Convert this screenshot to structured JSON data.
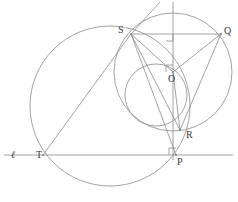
{
  "figure": {
    "stroke_color": "#8a8a8a",
    "label_color": "#3a3a3a",
    "background": "#ffffff",
    "width": 238,
    "height": 202
  },
  "labels": [
    {
      "id": "ell",
      "text": "ℓ",
      "x": 11,
      "y": 150,
      "italic": true,
      "name": "label-line-ell"
    },
    {
      "id": "T",
      "text": "T",
      "x": 36,
      "y": 150,
      "italic": false,
      "name": "label-point-t"
    },
    {
      "id": "S",
      "text": "S",
      "x": 118,
      "y": 25,
      "italic": false,
      "name": "label-point-s"
    },
    {
      "id": "Q",
      "text": "Q",
      "x": 224,
      "y": 26,
      "italic": false,
      "name": "label-point-q"
    },
    {
      "id": "O",
      "text": "O",
      "x": 168,
      "y": 74,
      "italic": false,
      "name": "label-point-o"
    },
    {
      "id": "R",
      "text": "R",
      "x": 186,
      "y": 130,
      "italic": false,
      "name": "label-point-r"
    },
    {
      "id": "P",
      "text": "P",
      "x": 177,
      "y": 157,
      "italic": false,
      "name": "label-point-p"
    }
  ],
  "points": {
    "S": {
      "x": 131,
      "y": 34
    },
    "Q": {
      "x": 221,
      "y": 34
    },
    "O": {
      "x": 173,
      "y": 72
    },
    "R": {
      "x": 180,
      "y": 130
    },
    "P": {
      "x": 176,
      "y": 155
    },
    "T": {
      "x": 43,
      "y": 155
    },
    "L": {
      "x": 173,
      "y": 34
    }
  },
  "circles": [
    {
      "name": "circle-large-through-S-T-R",
      "cx": 110,
      "cy": 106,
      "r": 80
    },
    {
      "name": "circle-center-O-through-S-Q-R",
      "cx": 173,
      "cy": 72,
      "r": 59
    },
    {
      "name": "circle-small-through-S-O-R-P",
      "cx": 156,
      "cy": 95,
      "r": 31
    }
  ],
  "segments": [
    {
      "name": "segment-SQ",
      "x1": 131,
      "y1": 34,
      "x2": 221,
      "y2": 34
    },
    {
      "name": "segment-SO",
      "x1": 131,
      "y1": 34,
      "x2": 173,
      "y2": 72
    },
    {
      "name": "segment-OQ",
      "x1": 173,
      "y1": 72,
      "x2": 221,
      "y2": 34
    },
    {
      "name": "segment-OR",
      "x1": 173,
      "y1": 72,
      "x2": 180,
      "y2": 130
    },
    {
      "name": "segment-SR",
      "x1": 131,
      "y1": 34,
      "x2": 180,
      "y2": 130
    },
    {
      "name": "segment-SP",
      "x1": 131,
      "y1": 34,
      "x2": 176,
      "y2": 155
    },
    {
      "name": "segment-QR",
      "x1": 221,
      "y1": 34,
      "x2": 180,
      "y2": 130
    },
    {
      "name": "segment-ST",
      "x1": 131,
      "y1": 34,
      "x2": 43,
      "y2": 155
    },
    {
      "name": "segment-tangent-at-S",
      "x1": 131,
      "y1": 34,
      "x2": 160,
      "y2": 2
    }
  ],
  "lines": [
    {
      "name": "line-ell-horizontal",
      "x1": 4,
      "y1": 155,
      "x2": 233,
      "y2": 155
    },
    {
      "name": "line-vertical-through-O-P",
      "x1": 173,
      "y1": 2,
      "x2": 173,
      "y2": 160
    }
  ],
  "right_angles": [
    {
      "name": "right-angle-marker-at-L",
      "x": 166,
      "y": 34,
      "size": 7,
      "dx": 1,
      "dy": 1
    },
    {
      "name": "right-angle-marker-at-O",
      "x": 173,
      "y": 72,
      "size": 7,
      "dx": -1,
      "dy": -1
    },
    {
      "name": "right-angle-marker-at-P",
      "x": 176,
      "y": 155,
      "size": 7,
      "dx": -1,
      "dy": -1
    }
  ]
}
